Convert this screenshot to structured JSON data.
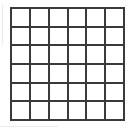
{
  "figure": {
    "kind": "grid-diagram",
    "background_color": "#ffffff",
    "line_color": "#3a3a3a",
    "line_width_px": 2,
    "columns": 6,
    "rows": 6,
    "cell_count": 36,
    "bounds": {
      "left_px": 10,
      "top_px": 7,
      "right_px": 125,
      "bottom_px": 121,
      "width_px": 115,
      "height_px": 114
    },
    "cell_size_px": 19,
    "cells": [
      [
        1,
        2,
        3,
        4,
        5,
        6
      ],
      [
        7,
        8,
        9,
        10,
        11,
        12
      ],
      [
        13,
        14,
        15,
        16,
        17,
        18
      ],
      [
        19,
        20,
        21,
        22,
        23,
        24
      ],
      [
        25,
        26,
        27,
        28,
        29,
        30
      ],
      [
        31,
        32,
        33,
        34,
        35,
        36
      ]
    ],
    "cell_labels": [
      [
        "",
        "",
        "",
        "",
        "",
        ""
      ],
      [
        "",
        "",
        "",
        "",
        "",
        ""
      ],
      [
        "",
        "",
        "",
        "",
        "",
        ""
      ],
      [
        "",
        "",
        "",
        "",
        "",
        ""
      ],
      [
        "",
        "",
        "",
        "",
        "",
        ""
      ],
      [
        "",
        "",
        "",
        "",
        "",
        ""
      ]
    ]
  },
  "canvas": {
    "width_px": 134,
    "height_px": 129
  }
}
